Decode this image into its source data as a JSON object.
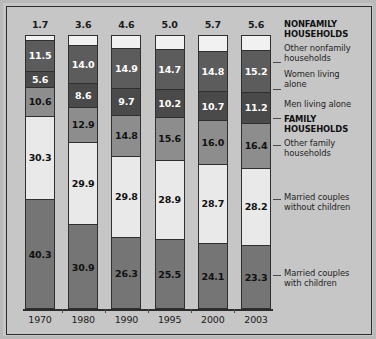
{
  "chart_data": {
    "type": "bar",
    "subtype": "stacked-percent",
    "title": "",
    "xlabel": "",
    "ylabel": "",
    "ylim": [
      0,
      100
    ],
    "grid": false,
    "legend_position": "right",
    "categories": [
      "1970",
      "1980",
      "1990",
      "1995",
      "2000",
      "2003"
    ],
    "stack_order_bottom_to_top": [
      "Married couples with children",
      "Married couples without children",
      "Other family households",
      "Men living alone",
      "Women living alone",
      "Other nonfamily households"
    ],
    "series": [
      {
        "name": "Married couples with children",
        "group": "FAMILY HOUSEHOLDS",
        "color": "#757575",
        "label_style": "dark",
        "values": [
          40.3,
          30.9,
          26.3,
          25.5,
          24.1,
          23.3
        ]
      },
      {
        "name": "Married couples without children",
        "group": "FAMILY HOUSEHOLDS",
        "color": "#e9e9e9",
        "label_style": "light",
        "values": [
          30.3,
          29.9,
          29.8,
          28.9,
          28.7,
          28.2
        ]
      },
      {
        "name": "Other family households",
        "group": "FAMILY HOUSEHOLDS",
        "color": "#8d8d8d",
        "label_style": "light",
        "values": [
          10.6,
          12.9,
          14.8,
          15.6,
          16.0,
          16.4
        ]
      },
      {
        "name": "Men living alone",
        "group": "NONFAMILY HOUSEHOLDS",
        "color": "#4a4a4a",
        "label_style": "dark",
        "values": [
          5.6,
          8.6,
          9.7,
          10.2,
          10.7,
          11.2
        ]
      },
      {
        "name": "Women living alone",
        "group": "NONFAMILY HOUSEHOLDS",
        "color": "#5c5c5c",
        "label_style": "dark",
        "values": [
          11.5,
          14.0,
          14.9,
          14.7,
          14.8,
          15.2
        ]
      },
      {
        "name": "Other nonfamily households",
        "group": "NONFAMILY HOUSEHOLDS",
        "color": "#f1f1f1",
        "label_style": "above",
        "values": [
          1.7,
          3.6,
          4.6,
          5.0,
          5.7,
          5.6
        ]
      }
    ]
  },
  "bars": [
    {
      "year": "1970",
      "top_value": "1.7",
      "segments": [
        {
          "value": "1.7",
          "pct": 1.7,
          "color": "#f1f1f1",
          "text": "v-none"
        },
        {
          "value": "11.5",
          "pct": 11.5,
          "color": "#5c5c5c",
          "text": "v-dark"
        },
        {
          "value": "5.6",
          "pct": 5.6,
          "color": "#4a4a4a",
          "text": "v-dark"
        },
        {
          "value": "10.6",
          "pct": 10.6,
          "color": "#8d8d8d",
          "text": "v-light"
        },
        {
          "value": "30.3",
          "pct": 30.3,
          "color": "#e9e9e9",
          "text": "v-light"
        },
        {
          "value": "40.3",
          "pct": 40.3,
          "color": "#757575",
          "text": "v-light"
        }
      ]
    },
    {
      "year": "1980",
      "top_value": "3.6",
      "segments": [
        {
          "value": "3.6",
          "pct": 3.6,
          "color": "#f1f1f1",
          "text": "v-none"
        },
        {
          "value": "14.0",
          "pct": 14.0,
          "color": "#5c5c5c",
          "text": "v-dark"
        },
        {
          "value": "8.6",
          "pct": 8.6,
          "color": "#4a4a4a",
          "text": "v-dark"
        },
        {
          "value": "12.9",
          "pct": 12.9,
          "color": "#8d8d8d",
          "text": "v-light"
        },
        {
          "value": "29.9",
          "pct": 29.9,
          "color": "#e9e9e9",
          "text": "v-light"
        },
        {
          "value": "30.9",
          "pct": 30.9,
          "color": "#757575",
          "text": "v-light"
        }
      ]
    },
    {
      "year": "1990",
      "top_value": "4.6",
      "segments": [
        {
          "value": "4.6",
          "pct": 4.6,
          "color": "#f1f1f1",
          "text": "v-none"
        },
        {
          "value": "14.9",
          "pct": 14.9,
          "color": "#5c5c5c",
          "text": "v-dark"
        },
        {
          "value": "9.7",
          "pct": 9.7,
          "color": "#4a4a4a",
          "text": "v-dark"
        },
        {
          "value": "14.8",
          "pct": 14.8,
          "color": "#8d8d8d",
          "text": "v-light"
        },
        {
          "value": "29.8",
          "pct": 29.8,
          "color": "#e9e9e9",
          "text": "v-light"
        },
        {
          "value": "26.3",
          "pct": 26.3,
          "color": "#757575",
          "text": "v-light"
        }
      ]
    },
    {
      "year": "1995",
      "top_value": "5.0",
      "segments": [
        {
          "value": "5.0",
          "pct": 5.0,
          "color": "#f1f1f1",
          "text": "v-none"
        },
        {
          "value": "14.7",
          "pct": 14.7,
          "color": "#5c5c5c",
          "text": "v-dark"
        },
        {
          "value": "10.2",
          "pct": 10.2,
          "color": "#4a4a4a",
          "text": "v-dark"
        },
        {
          "value": "15.6",
          "pct": 15.6,
          "color": "#8d8d8d",
          "text": "v-light"
        },
        {
          "value": "28.9",
          "pct": 28.9,
          "color": "#e9e9e9",
          "text": "v-light"
        },
        {
          "value": "25.5",
          "pct": 25.5,
          "color": "#757575",
          "text": "v-light"
        }
      ]
    },
    {
      "year": "2000",
      "top_value": "5.7",
      "segments": [
        {
          "value": "5.7",
          "pct": 5.7,
          "color": "#f1f1f1",
          "text": "v-none"
        },
        {
          "value": "14.8",
          "pct": 14.8,
          "color": "#5c5c5c",
          "text": "v-dark"
        },
        {
          "value": "10.7",
          "pct": 10.7,
          "color": "#4a4a4a",
          "text": "v-dark"
        },
        {
          "value": "16.0",
          "pct": 16.0,
          "color": "#8d8d8d",
          "text": "v-light"
        },
        {
          "value": "28.7",
          "pct": 28.7,
          "color": "#e9e9e9",
          "text": "v-light"
        },
        {
          "value": "24.1",
          "pct": 24.1,
          "color": "#757575",
          "text": "v-light"
        }
      ]
    },
    {
      "year": "2003",
      "top_value": "5.6",
      "segments": [
        {
          "value": "5.6",
          "pct": 5.6,
          "color": "#f1f1f1",
          "text": "v-none"
        },
        {
          "value": "15.2",
          "pct": 15.2,
          "color": "#5c5c5c",
          "text": "v-dark"
        },
        {
          "value": "11.2",
          "pct": 11.2,
          "color": "#4a4a4a",
          "text": "v-dark"
        },
        {
          "value": "16.4",
          "pct": 16.4,
          "color": "#8d8d8d",
          "text": "v-light"
        },
        {
          "value": "28.2",
          "pct": 28.2,
          "color": "#e9e9e9",
          "text": "v-light"
        },
        {
          "value": "23.3",
          "pct": 23.3,
          "color": "#757575",
          "text": "v-light"
        }
      ]
    }
  ],
  "legend": [
    {
      "text": "NONFAMILY",
      "bold": true,
      "top": 3,
      "leader": null
    },
    {
      "text": "HOUSEHOLDS",
      "bold": true,
      "top": 13,
      "leader": null
    },
    {
      "text": "Other nonfamily",
      "bold": false,
      "top": 27,
      "leader": 45
    },
    {
      "text": "households",
      "bold": false,
      "top": 37,
      "leader": null
    },
    {
      "text": "Women living",
      "bold": false,
      "top": 53,
      "leader": 72
    },
    {
      "text": "alone",
      "bold": false,
      "top": 63,
      "leader": null
    },
    {
      "text": "Men living alone",
      "bold": false,
      "top": 83,
      "leader": 101
    },
    {
      "text": "FAMILY",
      "bold": true,
      "top": 98,
      "leader": null
    },
    {
      "text": "HOUSEHOLDS",
      "bold": true,
      "top": 108,
      "leader": null
    },
    {
      "text": "Other family",
      "bold": false,
      "top": 122,
      "leader": 128
    },
    {
      "text": "households",
      "bold": false,
      "top": 132,
      "leader": null
    },
    {
      "text": "Married couples",
      "bold": false,
      "top": 176,
      "leader": 182
    },
    {
      "text": "without children",
      "bold": false,
      "top": 186,
      "leader": null
    },
    {
      "text": "Married couples",
      "bold": false,
      "top": 252,
      "leader": 258
    },
    {
      "text": "with children",
      "bold": false,
      "top": 262,
      "leader": null
    }
  ],
  "colors": {
    "background": "#c6c6c6",
    "frame_border": "#2c2c2c",
    "axis": "#2c2c2c",
    "married_with_children": "#757575",
    "married_without_children": "#e9e9e9",
    "other_family": "#8d8d8d",
    "men_alone": "#4a4a4a",
    "women_alone": "#5c5c5c",
    "other_nonfamily": "#f1f1f1"
  }
}
